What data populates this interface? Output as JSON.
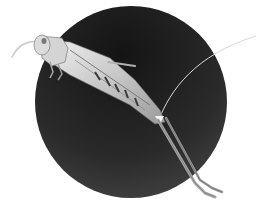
{
  "image": {
    "subject": "grasshopper",
    "description": "Grasshopper photographed in profile, leaping diagonally across a dark circular backdrop on a white background",
    "background_color": "#ffffff",
    "circle": {
      "cx": 131,
      "cy": 102,
      "r": 96,
      "color_top": "#141414",
      "color_bottom": "#454545"
    },
    "insect_colors": {
      "light": "#e6e6e6",
      "mid": "#b5b5b5",
      "dark": "#5a5a5a"
    }
  }
}
